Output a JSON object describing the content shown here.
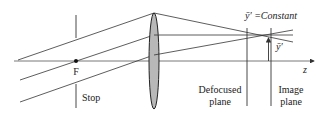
{
  "labels": {
    "focal_point": "F",
    "stop": "Stop",
    "constant": "ȳ′ =Constant",
    "image_height": "ȳ′",
    "axis": "z",
    "defocused_line1": "Defocused",
    "defocused_line2": "plane",
    "image_line1": "Image",
    "image_line2": "plane"
  },
  "colors": {
    "line": "#333333",
    "lens_fill": "#b8b8b8",
    "background": "#ffffff"
  },
  "geometry": {
    "axis_y": 61,
    "stop_x": 76,
    "lens_x": 154,
    "defocused_plane_x": 247,
    "image_plane_x": 271,
    "focus_point": [
      270,
      35
    ]
  }
}
